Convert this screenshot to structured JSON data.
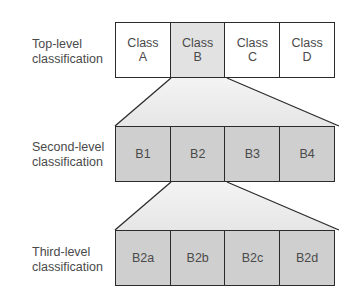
{
  "diagram": {
    "type": "hierarchical-classification",
    "colors": {
      "border": "#2b2b2b",
      "text": "#4a4a4a",
      "selected_top": "#e2e2e2",
      "lower_levels": "#cfcfcf",
      "connector_fill": "#ececec"
    },
    "levels": [
      {
        "label": "Top-level\nclassification",
        "boxes": [
          "Class\nA",
          "Class\nB",
          "Class\nC",
          "Class\nD"
        ],
        "expanded_index": 1
      },
      {
        "label": "Second-level\nclassification",
        "boxes": [
          "B1",
          "B2",
          "B3",
          "B4"
        ],
        "expanded_index": 1
      },
      {
        "label": "Third-level\nclassification",
        "boxes": [
          "B2a",
          "B2b",
          "B2c",
          "B2d"
        ]
      }
    ]
  }
}
